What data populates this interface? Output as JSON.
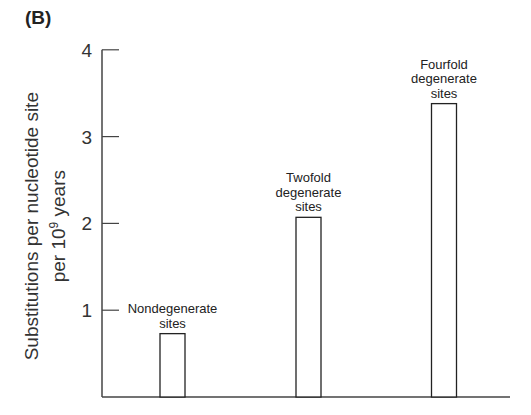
{
  "panel_label": "(B)",
  "ylabel": {
    "line1": "Substitutions per nucleotide site",
    "line2_prefix": "per 10",
    "line2_exp": "9",
    "line2_suffix": " years"
  },
  "chart_data": {
    "type": "bar",
    "title": "",
    "xlabel": "",
    "ylabel": "Substitutions per nucleotide site per 10^9 years",
    "categories": [
      "Nondegenerate sites",
      "Twofold degenerate sites",
      "Fourfold degenerate sites"
    ],
    "category_label_lines": [
      [
        "Nondegenerate",
        "sites"
      ],
      [
        "Twofold",
        "degenerate",
        "sites"
      ],
      [
        "Fourfold",
        "degenerate",
        "sites"
      ]
    ],
    "values": [
      0.73,
      2.07,
      3.38
    ],
    "ylim": [
      0,
      4
    ],
    "yticks": [
      1,
      2,
      3,
      4
    ],
    "grid": false,
    "legend": "none"
  },
  "colors": {
    "axis": "#444444",
    "bar_fill": "#ffffff",
    "bar_stroke": "#222222"
  }
}
